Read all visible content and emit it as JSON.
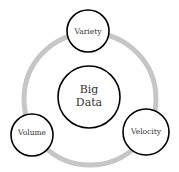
{
  "diagram": {
    "title": "Big Data",
    "center": {
      "label_line1": "Big",
      "label_line2": "Data"
    },
    "nodes": [
      {
        "label": "Variety"
      },
      {
        "label": "Volume"
      },
      {
        "label": "Velocity"
      }
    ],
    "colors": {
      "ring": "#c6c6c6",
      "circle_stroke": "#000000",
      "text": "#333333",
      "background": "#ffffff"
    }
  }
}
